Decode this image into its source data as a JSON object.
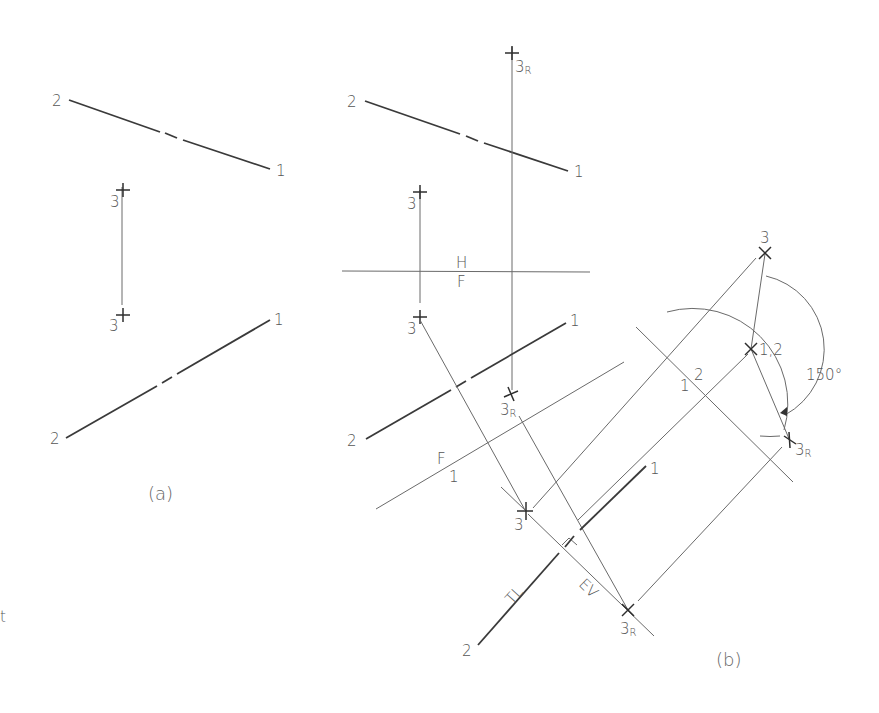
{
  "figure": {
    "caption_a": "(a)",
    "caption_b": "(b)",
    "stray_mark": "t"
  },
  "view_a": {
    "top_line": {
      "end_left": "2",
      "end_right": "1"
    },
    "point3_top": {
      "label": "3"
    },
    "point3_bottom": {
      "label": "3"
    },
    "bottom_line": {
      "end_left": "2",
      "end_right": "1"
    }
  },
  "view_b": {
    "top_line": {
      "end_left": "2",
      "end_right": "1"
    },
    "point3_top": {
      "label": "3"
    },
    "point3r_top": {
      "label": "3",
      "sub": "R"
    },
    "fold_hf": {
      "upper": "H",
      "lower": "F"
    },
    "front_line": {
      "end_left": "2",
      "end_right": "1"
    },
    "point3_front": {
      "label": "3"
    },
    "point3r_front": {
      "label": "3",
      "sub": "R"
    },
    "fold_f1": {
      "upper": "F",
      "lower": "1"
    },
    "aux_point3": {
      "label": "3"
    },
    "aux_line": {
      "end_left": "2",
      "end_right": "1",
      "tl_label": "TL",
      "ev_label": "EV"
    },
    "aux_point3r": {
      "label": "3",
      "sub": "R"
    },
    "fold_12": {
      "left": "1",
      "right": "2"
    },
    "end_view_point3": {
      "label": "3"
    },
    "end_view_point12": {
      "label": "1,2"
    },
    "end_view_point3r": {
      "label": "3",
      "sub": "R"
    },
    "rotation_angle": "150°"
  }
}
